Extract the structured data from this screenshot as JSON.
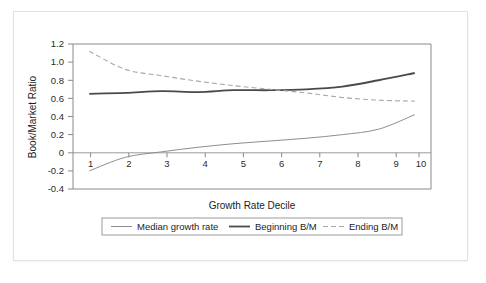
{
  "chart_data": {
    "type": "line",
    "title": "",
    "xlabel": "Growth Rate Decile",
    "ylabel": "Book/Market Ratio",
    "categories": [
      "1",
      "2",
      "3",
      "4",
      "5",
      "6",
      "7",
      "8",
      "9",
      "10"
    ],
    "x": [
      1,
      2,
      3,
      4,
      5,
      6,
      7,
      8,
      9,
      10
    ],
    "xlim": [
      0.55,
      10.45
    ],
    "ylim": [
      -0.4,
      1.2
    ],
    "yticks": [
      "1.2",
      "1.0",
      "0.8",
      "0.6",
      "0.4",
      "0.2",
      "0",
      "-0.2",
      "-0.4"
    ],
    "ytick_values": [
      1.2,
      1.0,
      0.8,
      0.6,
      0.4,
      0.2,
      0,
      -0.2,
      -0.4
    ],
    "xticks": [
      "1",
      "2",
      "3",
      "4",
      "5",
      "6",
      "7",
      "8",
      "9",
      "10"
    ],
    "grid": false,
    "legend_position": "bottom",
    "zero_line": true,
    "series": [
      {
        "name": "Median growth rate",
        "style": "solid-thin",
        "color": "#8e8e8e",
        "values": [
          -0.2,
          -0.05,
          0.01,
          0.06,
          0.1,
          0.13,
          0.16,
          0.2,
          0.26,
          0.42
        ]
      },
      {
        "name": "Beginning B/M",
        "style": "solid-thick",
        "color": "#4a4a4a",
        "values": [
          0.65,
          0.66,
          0.68,
          0.67,
          0.69,
          0.69,
          0.7,
          0.73,
          0.8,
          0.88
        ]
      },
      {
        "name": "Ending B/M",
        "style": "dashed",
        "color": "#a8a8a8",
        "values": [
          1.12,
          0.92,
          0.85,
          0.79,
          0.74,
          0.7,
          0.66,
          0.61,
          0.58,
          0.57
        ]
      }
    ]
  },
  "legend": {
    "items": [
      {
        "label": "Median growth rate"
      },
      {
        "label": "Beginning B/M"
      },
      {
        "label": "Ending B/M"
      }
    ]
  },
  "axes": {
    "y_title": "Book/Market Ratio",
    "x_title": "Growth Rate Decile"
  }
}
